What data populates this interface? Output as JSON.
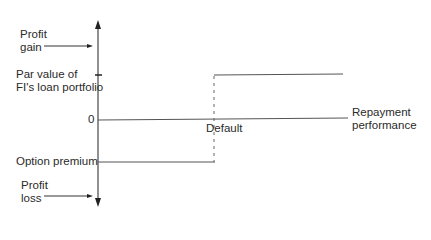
{
  "labels": {
    "profit_gain": [
      "Profit",
      "gain"
    ],
    "par_value": [
      "Par value of",
      "FI's loan portfolio"
    ],
    "zero": "0",
    "option_premium": "Option premium",
    "profit_loss": [
      "Profit",
      "loss"
    ],
    "default": "Default",
    "repayment": [
      "Repayment",
      "performance"
    ]
  },
  "colors": {
    "line": "#555555",
    "text": "#2a2a2a"
  }
}
